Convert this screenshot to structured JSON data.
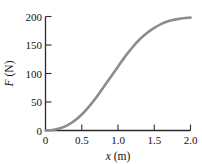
{
  "chart_data": {
    "type": "line",
    "title": "",
    "xlabel": "x (m)",
    "ylabel": "F (N)",
    "xlabel_symbol": "x",
    "xlabel_unit": "(m)",
    "ylabel_symbol": "F",
    "ylabel_unit": "(N)",
    "xlim": [
      0,
      2.0
    ],
    "ylim": [
      0,
      200
    ],
    "xticks": [
      0,
      0.5,
      1.0,
      1.5,
      2.0
    ],
    "xticklabels": [
      "0",
      "0.5",
      "1.0",
      "1.5",
      "2.0"
    ],
    "yticks": [
      0,
      50,
      100,
      150,
      200
    ],
    "yticklabels": [
      "0",
      "50",
      "100",
      "150",
      "200"
    ],
    "grid": false,
    "legend": false,
    "legend_position": "none",
    "series": [
      {
        "name": "F vs x",
        "color": "#8c8c8c",
        "linewidth": 2.6,
        "x": [
          0.0,
          0.1,
          0.2,
          0.3,
          0.4,
          0.5,
          0.6,
          0.7,
          0.8,
          0.9,
          1.0,
          1.1,
          1.2,
          1.3,
          1.4,
          1.5,
          1.6,
          1.7,
          1.8,
          1.9,
          2.0
        ],
        "y": [
          0,
          1,
          4,
          9,
          17,
          28,
          42,
          58,
          76,
          94,
          112,
          130,
          146,
          160,
          171,
          180,
          187,
          192,
          195,
          197,
          198
        ]
      }
    ],
    "axes_style": {
      "spines": [
        "left",
        "bottom"
      ],
      "tick_direction": "in",
      "axis_color": "#2b2b2b",
      "background": "#ffffff"
    }
  }
}
